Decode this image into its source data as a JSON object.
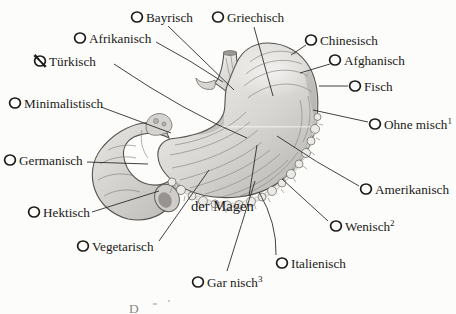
{
  "figure": {
    "subject": "der Magen",
    "caption_fragment": "D",
    "ink_color": "#1d1b1a",
    "paper_color": "#fcfcfa",
    "marker_style": "radio-circle",
    "crossed_option": "Türkisch"
  },
  "options": [
    {
      "id": "bayrisch",
      "label": "Bayrisch",
      "sup": "",
      "crossed": false,
      "circle": {
        "cx": 137,
        "cy": 17
      },
      "text": {
        "x": 146,
        "y": 21.5
      },
      "line": "M168,26 L234,90"
    },
    {
      "id": "griechisch",
      "label": "Griechisch",
      "sup": "",
      "crossed": false,
      "circle": {
        "cx": 218,
        "cy": 17
      },
      "text": {
        "x": 227,
        "y": 21.5
      },
      "line": "M254,27 L273,96"
    },
    {
      "id": "afrikanisch",
      "label": "Afrikanisch",
      "sup": "",
      "crossed": false,
      "circle": {
        "cx": 80,
        "cy": 38
      },
      "text": {
        "x": 89,
        "y": 42.5
      },
      "line": "M156,42 Q190,60 223,82"
    },
    {
      "id": "chinesisch",
      "label": "Chinesisch",
      "sup": "",
      "crossed": false,
      "circle": {
        "cx": 311,
        "cy": 40
      },
      "text": {
        "x": 320,
        "y": 44.5
      },
      "line": "M306,45 L291,55"
    },
    {
      "id": "tuerkisch",
      "label": "Türkisch",
      "sup": "",
      "crossed": true,
      "circle": {
        "cx": 40,
        "cy": 61
      },
      "text": {
        "x": 49,
        "y": 65.5
      },
      "line": "M114,64 Q185,112 247,138"
    },
    {
      "id": "afghanisch",
      "label": "Afghanisch",
      "sup": "",
      "crossed": false,
      "circle": {
        "cx": 335,
        "cy": 60
      },
      "text": {
        "x": 344,
        "y": 64.5
      },
      "line": "M330,64 L300,73"
    },
    {
      "id": "fisch",
      "label": "Fisch",
      "sup": "",
      "crossed": false,
      "circle": {
        "cx": 355,
        "cy": 86
      },
      "text": {
        "x": 364,
        "y": 90.5
      },
      "line": "M348,86 L319,86"
    },
    {
      "id": "minimalistisch",
      "label": "Minimalistisch",
      "sup": "",
      "crossed": false,
      "circle": {
        "cx": 15,
        "cy": 103
      },
      "text": {
        "x": 24,
        "y": 107.5
      },
      "line": "M101,107 L171,133"
    },
    {
      "id": "ohne-misch",
      "label": "Ohne misch",
      "sup": "1",
      "crossed": false,
      "circle": {
        "cx": 375,
        "cy": 124
      },
      "text": {
        "x": 384,
        "y": 128.5
      },
      "line": "M368,122 L313,110"
    },
    {
      "id": "germanisch",
      "label": "Germanisch",
      "sup": "",
      "crossed": false,
      "circle": {
        "cx": 10,
        "cy": 160
      },
      "text": {
        "x": 19,
        "y": 164.5
      },
      "line": "M87,162 L148,164"
    },
    {
      "id": "amerikanisch",
      "label": "Amerikanisch",
      "sup": "",
      "crossed": false,
      "circle": {
        "cx": 366,
        "cy": 189
      },
      "text": {
        "x": 375,
        "y": 193.5
      },
      "line": "M359,186 Q315,162 277,136"
    },
    {
      "id": "hektisch",
      "label": "Hektisch",
      "sup": "",
      "crossed": false,
      "circle": {
        "cx": 34,
        "cy": 212
      },
      "text": {
        "x": 43,
        "y": 216.5
      },
      "line": "M92,212 L159,191"
    },
    {
      "id": "wenisch",
      "label": "Wenisch",
      "sup": "2",
      "crossed": false,
      "circle": {
        "cx": 336,
        "cy": 226
      },
      "text": {
        "x": 345,
        "y": 230.5
      },
      "line": "M328,221 L282,179"
    },
    {
      "id": "der-magen",
      "label": "der Magen",
      "sup": "",
      "crossed": false,
      "circle": null,
      "large": true,
      "text": {
        "x": 191,
        "y": 211
      },
      "line": "M249,196 L257,145"
    },
    {
      "id": "vegetarisch",
      "label": "Vegetarisch",
      "sup": "",
      "crossed": false,
      "circle": {
        "cx": 83,
        "cy": 246
      },
      "text": {
        "x": 92,
        "y": 250.5
      },
      "line": "M159,241 L209,170"
    },
    {
      "id": "italienisch",
      "label": "Italienisch",
      "sup": "",
      "crossed": false,
      "circle": {
        "cx": 282,
        "cy": 263
      },
      "text": {
        "x": 291,
        "y": 267.5
      },
      "line": "M276,255 Q277,223 259,192"
    },
    {
      "id": "gar-nisch",
      "label": "Gar nisch",
      "sup": "3",
      "crossed": false,
      "circle": {
        "cx": 198,
        "cy": 282
      },
      "text": {
        "x": 207,
        "y": 286.5
      },
      "line": "M227,271 Q242,223 255,181"
    }
  ]
}
